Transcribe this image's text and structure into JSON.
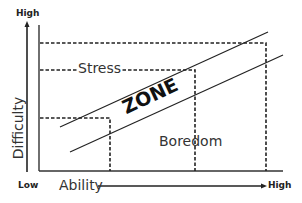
{
  "diagram": {
    "y_axis": {
      "label": "Difficulty",
      "high_label": "High"
    },
    "x_axis": {
      "label": "Ability",
      "low_label": "Low",
      "high_label": "High"
    },
    "regions": {
      "upper": "Stress",
      "middle": "ZONE",
      "lower": "Boredom"
    },
    "colors": {
      "line": "#222222",
      "text": "#333333",
      "background": "#ffffff"
    }
  }
}
